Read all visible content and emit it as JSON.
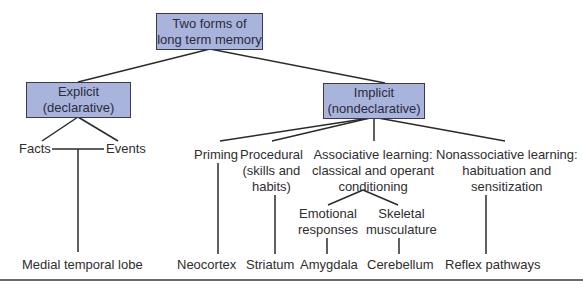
{
  "root": {
    "line1": "Two forms of",
    "line2": "long term memory"
  },
  "explicit": {
    "line1": "Explicit",
    "line2": "(declarative)"
  },
  "implicit": {
    "line1": "Implicit",
    "line2": "(nondeclarative)"
  },
  "explicit_children": {
    "facts": "Facts",
    "events": "Events"
  },
  "implicit_children": {
    "priming": "Priming",
    "procedural": {
      "line1": "Procedural",
      "line2": "(skills and",
      "line3": "habits)"
    },
    "associative": {
      "line1": "Associative learning:",
      "line2": "classical and operant",
      "line3": "conditioning"
    },
    "nonassociative": {
      "line1": "Nonassociative learning:",
      "line2": "habituation and",
      "line3": "sensitization"
    }
  },
  "associative_children": {
    "emotional": {
      "line1": "Emotional",
      "line2": "responses"
    },
    "skeletal": {
      "line1": "Skeletal",
      "line2": "musculature"
    }
  },
  "brain_regions": {
    "medial_temporal_lobe": "Medial temporal lobe",
    "neocortex": "Neocortex",
    "striatum": "Striatum",
    "amygdala": "Amygdala",
    "cerebellum": "Cerebellum",
    "reflex_pathways": "Reflex pathways"
  },
  "colors": {
    "box_fill": "#a9b4dd",
    "box_border": "#3a3a4a",
    "line": "#2a2a2a"
  }
}
